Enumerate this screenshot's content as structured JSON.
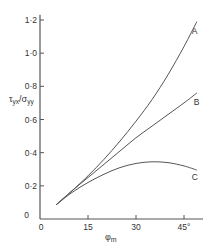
{
  "chart_data": {
    "type": "line",
    "title": "",
    "xlabel": "φm",
    "ylabel": "τyx/σyy",
    "xlim": [
      0,
      50
    ],
    "ylim": [
      0,
      1.22
    ],
    "grid": false,
    "legend": "inline curve labels at right end",
    "x_ticks": [
      "0",
      "15",
      "30",
      "45°"
    ],
    "x_tick_values": [
      0,
      15,
      30,
      45
    ],
    "y_ticks": [
      "0",
      "0·2",
      "0·4",
      "0·6",
      "0·8",
      "1·0",
      "1·2"
    ],
    "y_tick_values": [
      0,
      0.2,
      0.4,
      0.6,
      0.8,
      1.0,
      1.2
    ],
    "series": [
      {
        "name": "A",
        "x": [
          5,
          10,
          15,
          20,
          25,
          30,
          35,
          40,
          45,
          49
        ],
        "values": [
          0.085,
          0.17,
          0.26,
          0.36,
          0.47,
          0.59,
          0.72,
          0.87,
          1.04,
          1.19
        ]
      },
      {
        "name": "B",
        "x": [
          5,
          10,
          15,
          20,
          25,
          30,
          35,
          40,
          45,
          49
        ],
        "values": [
          0.085,
          0.17,
          0.25,
          0.33,
          0.41,
          0.49,
          0.56,
          0.63,
          0.7,
          0.76
        ]
      },
      {
        "name": "C",
        "x": [
          5,
          10,
          15,
          20,
          25,
          30,
          35,
          40,
          45,
          49
        ],
        "values": [
          0.085,
          0.16,
          0.22,
          0.27,
          0.31,
          0.335,
          0.345,
          0.34,
          0.32,
          0.295
        ]
      }
    ]
  }
}
